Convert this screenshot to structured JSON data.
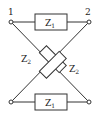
{
  "diagram": {
    "type": "lattice-network",
    "terminals": {
      "top_left": "1",
      "top_right": "2"
    },
    "impedances": {
      "series_top": {
        "label": "Z",
        "subscript": "1"
      },
      "series_bottom": {
        "label": "Z",
        "subscript": "1"
      },
      "cross_a": {
        "label": "Z",
        "subscript": "2"
      },
      "cross_b": {
        "label": "Z",
        "subscript": "2"
      }
    },
    "colors": {
      "stroke": "#333333",
      "background": "#ffffff"
    }
  }
}
